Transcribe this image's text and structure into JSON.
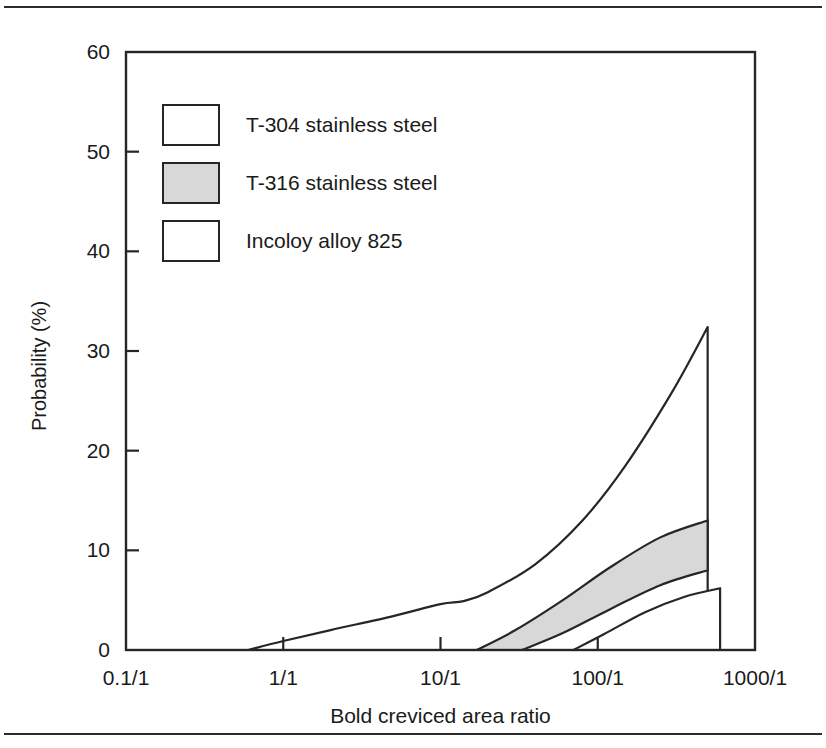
{
  "chart_data": {
    "type": "area",
    "title": "",
    "xlabel": "Bold creviced area ratio",
    "ylabel": "Probability (%)",
    "x_tick_labels": [
      "0.1/1",
      "1/1",
      "10/1",
      "100/1",
      "1000/1"
    ],
    "x_tick_values": [
      0.1,
      1,
      10,
      100,
      1000
    ],
    "x_scale": "log",
    "xlim": [
      0.1,
      1000
    ],
    "y_tick_labels": [
      "0",
      "10",
      "20",
      "30",
      "40",
      "50",
      "60"
    ],
    "y_tick_values": [
      0,
      10,
      20,
      30,
      40,
      50,
      60
    ],
    "ylim": [
      0,
      60
    ],
    "grid": false,
    "legend_position": "upper-left-inside",
    "legend": [
      {
        "label": "T-304 stainless steel",
        "fill": "#ffffff",
        "stroke": "#262626"
      },
      {
        "label": "T-316 stainless steel",
        "fill": "#d8d8d8",
        "stroke": "#262626"
      },
      {
        "label": "Incoloy alloy 825",
        "fill": "#ffffff",
        "stroke": "#262626"
      }
    ],
    "series": [
      {
        "name": "T-304 stainless steel",
        "fill": "#ffffff",
        "stroke": "#262626",
        "upper_curve": [
          {
            "x": 0.6,
            "y": 0.0
          },
          {
            "x": 1.0,
            "y": 0.9
          },
          {
            "x": 2.0,
            "y": 2.0
          },
          {
            "x": 5.0,
            "y": 3.4
          },
          {
            "x": 10.0,
            "y": 4.6
          },
          {
            "x": 14.0,
            "y": 4.9
          },
          {
            "x": 20.0,
            "y": 5.8
          },
          {
            "x": 40.0,
            "y": 8.6
          },
          {
            "x": 80.0,
            "y": 13.0
          },
          {
            "x": 150.0,
            "y": 18.5
          },
          {
            "x": 300.0,
            "y": 26.0
          },
          {
            "x": 500.0,
            "y": 32.4
          }
        ],
        "drop_x": 500.0,
        "drop_y_top": 32.4,
        "drop_y_bottom": 0.0
      },
      {
        "name": "T-316 stainless steel",
        "fill": "#d8d8d8",
        "stroke": "#262626",
        "upper_curve": [
          {
            "x": 17.0,
            "y": 0.0
          },
          {
            "x": 30.0,
            "y": 2.0
          },
          {
            "x": 60.0,
            "y": 5.0
          },
          {
            "x": 120.0,
            "y": 8.3
          },
          {
            "x": 250.0,
            "y": 11.3
          },
          {
            "x": 500.0,
            "y": 13.0
          }
        ],
        "lower_curve": [
          {
            "x": 33.0,
            "y": 0.0
          },
          {
            "x": 60.0,
            "y": 1.7
          },
          {
            "x": 120.0,
            "y": 4.1
          },
          {
            "x": 250.0,
            "y": 6.5
          },
          {
            "x": 500.0,
            "y": 8.0
          }
        ],
        "right_edge_x": 500.0,
        "right_edge_y_top": 13.0,
        "right_edge_y_bottom": 8.0
      },
      {
        "name": "Incoloy alloy 825",
        "fill": "#ffffff",
        "stroke": "#262626",
        "upper_curve": [
          {
            "x": 70.0,
            "y": 0.0
          },
          {
            "x": 110.0,
            "y": 1.6
          },
          {
            "x": 200.0,
            "y": 3.8
          },
          {
            "x": 350.0,
            "y": 5.3
          },
          {
            "x": 600.0,
            "y": 6.2
          }
        ],
        "right_edge_x": 600.0,
        "right_edge_y_top": 6.2,
        "right_edge_y_bottom": 0.0
      }
    ]
  },
  "axes": {
    "frame_color": "#262626"
  }
}
